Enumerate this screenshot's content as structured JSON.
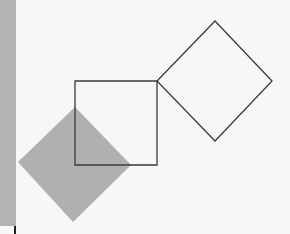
{
  "figure": {
    "colors": {
      "background": "#f7f7f5",
      "strip": "#b4b4b4",
      "shaded": "#b0b0b0",
      "stroke": "#3a3a3a"
    },
    "shapes": {
      "square_upright": {
        "points": "75,81 157,81 157,165 75,165",
        "fill": "none"
      },
      "square_tilted": {
        "points": "215,21 272,81 215,141 157,81",
        "fill": "none"
      },
      "square_shaded": {
        "points": "75,107 131,165 73,222 18,162",
        "fill": "#b0b0b0"
      }
    }
  }
}
